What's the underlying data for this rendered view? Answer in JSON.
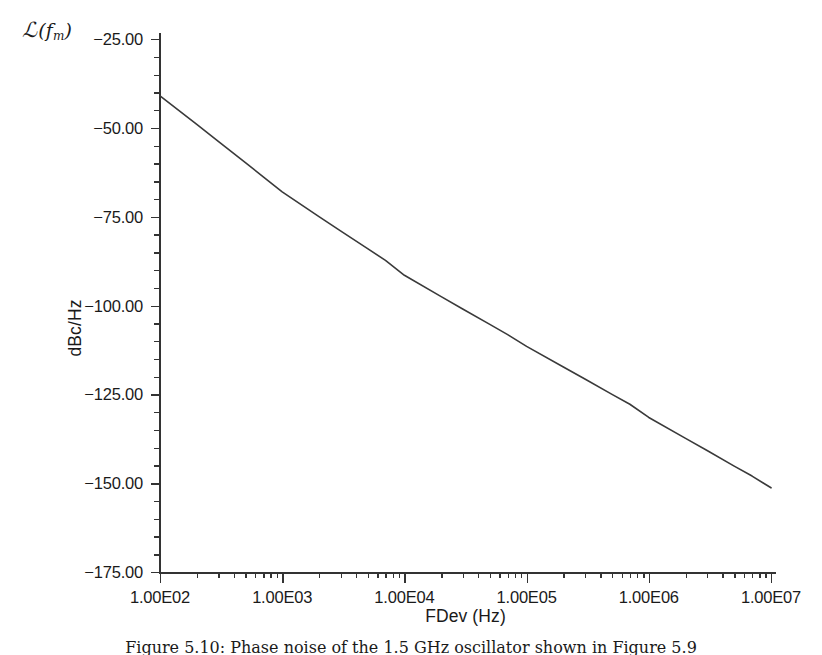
{
  "figure": {
    "phase_noise_symbol": {
      "script_l": "ℒ",
      "open_paren": "(",
      "variable": "f",
      "subscript": "m",
      "close_paren": ")"
    },
    "caption": "Figure 5.10: Phase noise of the 1.5 GHz oscillator shown in Figure 5.9"
  },
  "chart_data": {
    "type": "line",
    "title": "",
    "xlabel": "FDev (Hz)",
    "ylabel": "dBc/Hz",
    "xscale": "log",
    "yscale": "linear",
    "xlim": [
      100,
      10000000
    ],
    "ylim": [
      -175,
      -25
    ],
    "grid": false,
    "legend": null,
    "xticks": [
      100,
      1000,
      10000,
      100000,
      1000000,
      10000000
    ],
    "xtick_labels": [
      "1.00E02",
      "1.00E03",
      "1.00E04",
      "1.00E05",
      "1.00E06",
      "1.00E07"
    ],
    "yticks": [
      -25,
      -50,
      -75,
      -100,
      -125,
      -150,
      -175
    ],
    "ytick_labels": [
      "-25.00",
      "-50.00",
      "-75.00",
      "-100.00",
      "-125.00",
      "-150.00",
      "-175.00"
    ],
    "y_minor_per_major": 5,
    "line_color": "#3a3a3a",
    "line_width": 1.6,
    "series": [
      {
        "name": "phase noise",
        "x": [
          100,
          200,
          300,
          500,
          700,
          1000,
          2000,
          3000,
          5000,
          7000,
          10000,
          20000,
          30000,
          50000,
          70000,
          100000,
          200000,
          300000,
          500000,
          700000,
          1000000,
          2000000,
          3000000,
          5000000,
          7000000,
          10000000
        ],
        "y": [
          -41.0,
          -49.0,
          -53.8,
          -59.8,
          -63.8,
          -68.0,
          -75.0,
          -79.0,
          -84.0,
          -87.3,
          -91.5,
          -97.5,
          -101.0,
          -105.3,
          -108.2,
          -111.5,
          -117.3,
          -120.7,
          -125.0,
          -127.8,
          -131.5,
          -137.4,
          -140.8,
          -145.2,
          -148.0,
          -151.3
        ]
      }
    ]
  }
}
